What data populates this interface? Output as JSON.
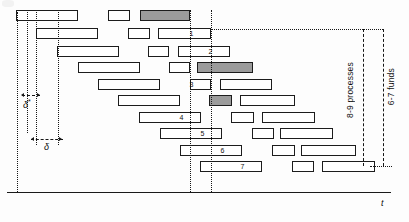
{
  "figure": {
    "type": "timeline-gantt-diagram",
    "axis": {
      "label": "t"
    },
    "annotations": {
      "delta_star": "δ",
      "delta_star_sup": "*",
      "delta": "δ",
      "right_bracket_inner": "8-9 processes",
      "right_bracket_outer": "6-7 funds"
    },
    "reference_lines": [
      {
        "name": "guide-1",
        "x": 17
      },
      {
        "name": "guide-2",
        "x": 27
      },
      {
        "name": "guide-3",
        "x": 36
      },
      {
        "name": "guide-4",
        "x": 58
      },
      {
        "name": "cut-line-1",
        "x": 190
      },
      {
        "name": "cut-line-2",
        "x": 211
      }
    ],
    "row_numbers": [
      "1",
      "2",
      "3",
      "4",
      "5",
      "6",
      "7"
    ],
    "rows": [
      {
        "index": 0,
        "y": 10,
        "bars": [
          {
            "x": 16,
            "w": 62,
            "shaded": false,
            "thick": true,
            "label": ""
          },
          {
            "x": 108,
            "w": 22,
            "shaded": false,
            "thick": false,
            "label": ""
          },
          {
            "x": 140,
            "w": 50,
            "shaded": true,
            "thick": false,
            "label": ""
          }
        ]
      },
      {
        "index": 1,
        "y": 28,
        "bars": [
          {
            "x": 36,
            "w": 62,
            "shaded": false,
            "thick": true,
            "label": ""
          },
          {
            "x": 128,
            "w": 22,
            "shaded": false,
            "thick": false,
            "label": ""
          },
          {
            "x": 158,
            "w": 53,
            "shaded": false,
            "thick": false,
            "label": "1"
          }
        ]
      },
      {
        "index": 2,
        "y": 46,
        "bars": [
          {
            "x": 57,
            "w": 62,
            "shaded": false,
            "thick": true,
            "label": ""
          },
          {
            "x": 148,
            "w": 21,
            "shaded": false,
            "thick": false,
            "label": ""
          },
          {
            "x": 178,
            "w": 52,
            "shaded": false,
            "thick": false,
            "label": "2"
          }
        ]
      },
      {
        "index": 3,
        "y": 62,
        "bars": [
          {
            "x": 78,
            "w": 62,
            "shaded": false,
            "thick": true,
            "label": ""
          },
          {
            "x": 169,
            "w": 21,
            "shaded": false,
            "thick": false,
            "label": ""
          },
          {
            "x": 197,
            "w": 56,
            "shaded": true,
            "thick": false,
            "label": ""
          }
        ]
      },
      {
        "index": 4,
        "y": 79,
        "bars": [
          {
            "x": 98,
            "w": 62,
            "shaded": false,
            "thick": true,
            "label": ""
          },
          {
            "x": 190,
            "w": 21,
            "shaded": false,
            "thick": false,
            "label": "3"
          },
          {
            "x": 220,
            "w": 52,
            "shaded": false,
            "thick": false,
            "label": ""
          }
        ]
      },
      {
        "index": 5,
        "y": 95,
        "bars": [
          {
            "x": 118,
            "w": 62,
            "shaded": false,
            "thick": true,
            "label": ""
          },
          {
            "x": 209,
            "w": 23,
            "shaded": true,
            "thick": false,
            "label": ""
          },
          {
            "x": 240,
            "w": 55,
            "shaded": false,
            "thick": false,
            "label": ""
          }
        ]
      },
      {
        "index": 6,
        "y": 112,
        "bars": [
          {
            "x": 139,
            "w": 62,
            "shaded": false,
            "thick": true,
            "label": "4"
          },
          {
            "x": 231,
            "w": 23,
            "shaded": false,
            "thick": false,
            "label": ""
          },
          {
            "x": 262,
            "w": 53,
            "shaded": false,
            "thick": false,
            "label": ""
          }
        ]
      },
      {
        "index": 7,
        "y": 128,
        "bars": [
          {
            "x": 160,
            "w": 62,
            "shaded": false,
            "thick": true,
            "label": "5"
          },
          {
            "x": 252,
            "w": 22,
            "shaded": false,
            "thick": false,
            "label": ""
          },
          {
            "x": 280,
            "w": 53,
            "shaded": false,
            "thick": false,
            "label": ""
          }
        ]
      },
      {
        "index": 8,
        "y": 145,
        "bars": [
          {
            "x": 180,
            "w": 62,
            "shaded": false,
            "thick": true,
            "label": "6"
          },
          {
            "x": 272,
            "w": 23,
            "shaded": false,
            "thick": false,
            "label": ""
          },
          {
            "x": 301,
            "w": 55,
            "shaded": false,
            "thick": false,
            "label": ""
          }
        ]
      },
      {
        "index": 9,
        "y": 161,
        "bars": [
          {
            "x": 200,
            "w": 62,
            "shaded": false,
            "thick": true,
            "label": "7"
          },
          {
            "x": 292,
            "w": 22,
            "shaded": false,
            "thick": false,
            "label": ""
          },
          {
            "x": 322,
            "w": 53,
            "shaded": false,
            "thick": false,
            "label": ""
          }
        ]
      }
    ]
  }
}
